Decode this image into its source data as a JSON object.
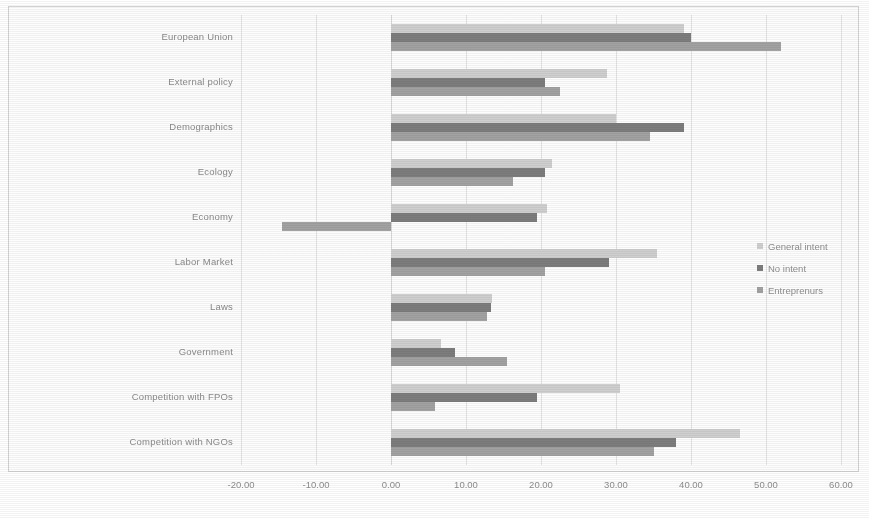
{
  "chart_data": {
    "type": "bar",
    "orientation": "horizontal",
    "title": "",
    "xlabel": "",
    "ylabel": "",
    "xlim": [
      -20,
      60
    ],
    "xticks": [
      "-20.00",
      "-10.00",
      "0.00",
      "10.00",
      "20.00",
      "30.00",
      "40.00",
      "50.00",
      "60.00"
    ],
    "xtick_values": [
      -20,
      -10,
      0,
      10,
      20,
      30,
      40,
      50,
      60
    ],
    "grid": true,
    "legend_position": "right",
    "categories": [
      "European Union",
      "External policy",
      "Demographics",
      "Ecology",
      "Economy",
      "Labor Market",
      "Laws",
      "Government",
      "Competition with FPOs",
      "Competition with NGOs"
    ],
    "series": [
      {
        "name": "General intent",
        "color": "#cfcfcf",
        "values": [
          39.0,
          28.8,
          30.0,
          21.5,
          20.8,
          35.5,
          13.5,
          6.7,
          30.5,
          46.5
        ]
      },
      {
        "name": "No intent",
        "color": "#7d7d7d",
        "values": [
          40.0,
          20.5,
          39.0,
          20.5,
          19.5,
          29.0,
          13.3,
          8.5,
          19.5,
          38.0
        ]
      },
      {
        "name": "Entreprenurs",
        "color": "#a2a2a2",
        "values": [
          52.0,
          22.5,
          34.5,
          16.3,
          -14.5,
          20.5,
          12.8,
          15.5,
          5.8,
          35.0
        ]
      }
    ]
  }
}
